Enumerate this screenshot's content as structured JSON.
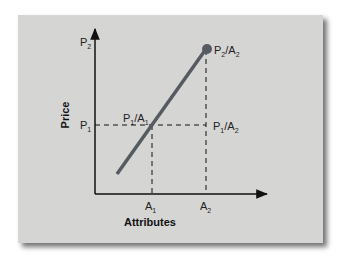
{
  "diagram": {
    "x_axis_label": "Attributes",
    "y_axis_label": "Price",
    "y_ticks": [
      {
        "main": "P",
        "sub": "2"
      },
      {
        "main": "P",
        "sub": "1"
      }
    ],
    "x_ticks": [
      {
        "main": "A",
        "sub": "1"
      },
      {
        "main": "A",
        "sub": "2"
      }
    ],
    "points": [
      {
        "label": "P1/A1",
        "parts": [
          {
            "main": "P",
            "sub": "1"
          },
          {
            "main": "/A",
            "sub": "1"
          }
        ]
      },
      {
        "label": "P1/A2",
        "parts": [
          {
            "main": "P",
            "sub": "1"
          },
          {
            "main": "/A",
            "sub": "2"
          }
        ]
      },
      {
        "label": "P2/A2",
        "parts": [
          {
            "main": "P",
            "sub": "2"
          },
          {
            "main": "/A",
            "sub": "2"
          }
        ]
      }
    ],
    "colors": {
      "card_background": "#d5d5d4",
      "line": "#565b61",
      "axis": "#111111"
    }
  }
}
